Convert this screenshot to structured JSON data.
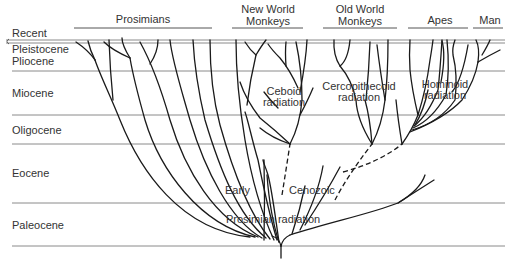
{
  "epochs": [
    {
      "label": "Recent",
      "y": 35
    },
    {
      "label": "Pleistocene",
      "y": 51
    },
    {
      "label": "Pliocene",
      "y": 63
    },
    {
      "label": "Miocene",
      "y": 96
    },
    {
      "label": "Oligocene",
      "y": 133
    },
    {
      "label": "Eocene",
      "y": 176
    },
    {
      "label": "Paleocene",
      "y": 228
    }
  ],
  "groups": [
    {
      "label_line1": "Prosimians",
      "label_line2": "",
      "x1": 74,
      "x2": 212
    },
    {
      "label_line1": "New World",
      "label_line2": "Monkeys",
      "x1": 232,
      "x2": 303
    },
    {
      "label_line1": "Old World",
      "label_line2": "Monkeys",
      "x1": 323,
      "x2": 397
    },
    {
      "label_line1": "Apes",
      "label_line2": "",
      "x1": 408,
      "x2": 468
    },
    {
      "label_line1": "Man",
      "label_line2": "",
      "x1": 473,
      "x2": 503
    }
  ],
  "annotations": {
    "ceboid_1": "Ceboid",
    "ceboid_2": "radiation",
    "cerco_1": "Cercopithecoid",
    "cerco_2": "radiation",
    "hominoid_1": "Hominoid",
    "hominoid_2": "radiation",
    "early": "Early",
    "cenozoic": "Cenozoic",
    "prosimian_radiation": "Prosimian radiation"
  },
  "boundaries_y": [
    40,
    43,
    71,
    115,
    144,
    203,
    246
  ],
  "colors": {
    "line": "#1a1a1a",
    "rule": "#8a8a8a",
    "text": "#333333"
  }
}
